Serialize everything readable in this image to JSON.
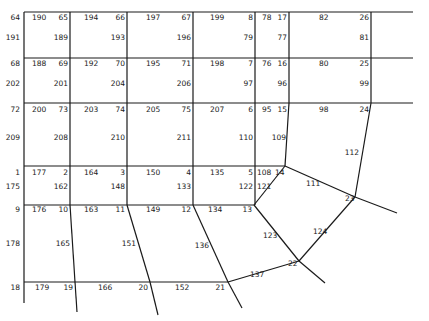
{
  "diagram": {
    "type": "finite-element-mesh",
    "edges": [
      [
        24,
        12,
        413,
        12
      ],
      [
        24,
        58,
        413,
        58
      ],
      [
        24,
        103,
        413,
        103
      ],
      [
        24,
        166,
        285,
        166
      ],
      [
        24,
        205,
        254,
        205
      ],
      [
        24,
        282,
        228,
        282
      ],
      [
        24,
        12,
        24,
        303
      ],
      [
        70,
        12,
        70,
        205
      ],
      [
        70,
        205,
        75,
        282
      ],
      [
        75,
        282,
        77,
        312
      ],
      [
        127,
        12,
        127,
        205
      ],
      [
        127,
        205,
        150,
        282
      ],
      [
        150,
        282,
        158,
        315
      ],
      [
        193,
        12,
        193,
        205
      ],
      [
        193,
        205,
        228,
        282
      ],
      [
        228,
        282,
        242,
        308
      ],
      [
        255,
        12,
        255,
        205
      ],
      [
        289,
        12,
        289,
        103
      ],
      [
        289,
        103,
        285,
        166
      ],
      [
        371,
        12,
        371,
        103
      ],
      [
        371,
        103,
        355,
        197
      ],
      [
        285,
        166,
        254,
        205
      ],
      [
        285,
        166,
        355,
        197
      ],
      [
        355,
        197,
        397,
        213
      ],
      [
        254,
        205,
        299,
        261
      ],
      [
        355,
        197,
        299,
        261
      ],
      [
        228,
        282,
        299,
        261
      ],
      [
        299,
        261,
        325,
        283
      ]
    ],
    "labels": [
      {
        "t": "64",
        "x": 20,
        "y": 20,
        "a": "end"
      },
      {
        "t": "190",
        "x": 32,
        "y": 20,
        "a": "start"
      },
      {
        "t": "65",
        "x": 68,
        "y": 20,
        "a": "end"
      },
      {
        "t": "194",
        "x": 84,
        "y": 20,
        "a": "start"
      },
      {
        "t": "66",
        "x": 125,
        "y": 20,
        "a": "end"
      },
      {
        "t": "197",
        "x": 146,
        "y": 20,
        "a": "start"
      },
      {
        "t": "67",
        "x": 191,
        "y": 20,
        "a": "end"
      },
      {
        "t": "199",
        "x": 210,
        "y": 20,
        "a": "start"
      },
      {
        "t": "8",
        "x": 253,
        "y": 20,
        "a": "end"
      },
      {
        "t": "78",
        "x": 262,
        "y": 20,
        "a": "start"
      },
      {
        "t": "17",
        "x": 287,
        "y": 20,
        "a": "end"
      },
      {
        "t": "82",
        "x": 319,
        "y": 20,
        "a": "start"
      },
      {
        "t": "26",
        "x": 369,
        "y": 20,
        "a": "end"
      },
      {
        "t": "191",
        "x": 20,
        "y": 40,
        "a": "end"
      },
      {
        "t": "189",
        "x": 68,
        "y": 40,
        "a": "end"
      },
      {
        "t": "193",
        "x": 125,
        "y": 40,
        "a": "end"
      },
      {
        "t": "196",
        "x": 191,
        "y": 40,
        "a": "end"
      },
      {
        "t": "79",
        "x": 253,
        "y": 40,
        "a": "end"
      },
      {
        "t": "77",
        "x": 287,
        "y": 40,
        "a": "end"
      },
      {
        "t": "81",
        "x": 369,
        "y": 40,
        "a": "end"
      },
      {
        "t": "68",
        "x": 20,
        "y": 66,
        "a": "end"
      },
      {
        "t": "188",
        "x": 32,
        "y": 66,
        "a": "start"
      },
      {
        "t": "69",
        "x": 68,
        "y": 66,
        "a": "end"
      },
      {
        "t": "192",
        "x": 84,
        "y": 66,
        "a": "start"
      },
      {
        "t": "70",
        "x": 125,
        "y": 66,
        "a": "end"
      },
      {
        "t": "195",
        "x": 146,
        "y": 66,
        "a": "start"
      },
      {
        "t": "71",
        "x": 191,
        "y": 66,
        "a": "end"
      },
      {
        "t": "198",
        "x": 210,
        "y": 66,
        "a": "start"
      },
      {
        "t": "7",
        "x": 253,
        "y": 66,
        "a": "end"
      },
      {
        "t": "76",
        "x": 262,
        "y": 66,
        "a": "start"
      },
      {
        "t": "16",
        "x": 287,
        "y": 66,
        "a": "end"
      },
      {
        "t": "80",
        "x": 319,
        "y": 66,
        "a": "start"
      },
      {
        "t": "25",
        "x": 369,
        "y": 66,
        "a": "end"
      },
      {
        "t": "202",
        "x": 20,
        "y": 86,
        "a": "end"
      },
      {
        "t": "201",
        "x": 68,
        "y": 86,
        "a": "end"
      },
      {
        "t": "204",
        "x": 125,
        "y": 86,
        "a": "end"
      },
      {
        "t": "206",
        "x": 191,
        "y": 86,
        "a": "end"
      },
      {
        "t": "97",
        "x": 253,
        "y": 86,
        "a": "end"
      },
      {
        "t": "96",
        "x": 287,
        "y": 86,
        "a": "end"
      },
      {
        "t": "99",
        "x": 369,
        "y": 86,
        "a": "end"
      },
      {
        "t": "72",
        "x": 20,
        "y": 112,
        "a": "end"
      },
      {
        "t": "200",
        "x": 32,
        "y": 112,
        "a": "start"
      },
      {
        "t": "73",
        "x": 68,
        "y": 112,
        "a": "end"
      },
      {
        "t": "203",
        "x": 84,
        "y": 112,
        "a": "start"
      },
      {
        "t": "74",
        "x": 125,
        "y": 112,
        "a": "end"
      },
      {
        "t": "205",
        "x": 146,
        "y": 112,
        "a": "start"
      },
      {
        "t": "75",
        "x": 191,
        "y": 112,
        "a": "end"
      },
      {
        "t": "207",
        "x": 210,
        "y": 112,
        "a": "start"
      },
      {
        "t": "6",
        "x": 253,
        "y": 112,
        "a": "end"
      },
      {
        "t": "95",
        "x": 262,
        "y": 112,
        "a": "start"
      },
      {
        "t": "15",
        "x": 287,
        "y": 112,
        "a": "end"
      },
      {
        "t": "98",
        "x": 319,
        "y": 112,
        "a": "start"
      },
      {
        "t": "24",
        "x": 369,
        "y": 112,
        "a": "end"
      },
      {
        "t": "209",
        "x": 20,
        "y": 140,
        "a": "end"
      },
      {
        "t": "208",
        "x": 68,
        "y": 140,
        "a": "end"
      },
      {
        "t": "210",
        "x": 125,
        "y": 140,
        "a": "end"
      },
      {
        "t": "211",
        "x": 191,
        "y": 140,
        "a": "end"
      },
      {
        "t": "110",
        "x": 253,
        "y": 140,
        "a": "end"
      },
      {
        "t": "109",
        "x": 286,
        "y": 140,
        "a": "end"
      },
      {
        "t": "112",
        "x": 359,
        "y": 155,
        "a": "end"
      },
      {
        "t": "1",
        "x": 20,
        "y": 175,
        "a": "end"
      },
      {
        "t": "177",
        "x": 32,
        "y": 175,
        "a": "start"
      },
      {
        "t": "2",
        "x": 68,
        "y": 175,
        "a": "end"
      },
      {
        "t": "164",
        "x": 84,
        "y": 175,
        "a": "start"
      },
      {
        "t": "3",
        "x": 125,
        "y": 175,
        "a": "end"
      },
      {
        "t": "150",
        "x": 146,
        "y": 175,
        "a": "start"
      },
      {
        "t": "4",
        "x": 191,
        "y": 175,
        "a": "end"
      },
      {
        "t": "135",
        "x": 210,
        "y": 175,
        "a": "start"
      },
      {
        "t": "5",
        "x": 253,
        "y": 175,
        "a": "end"
      },
      {
        "t": "108",
        "x": 257,
        "y": 175,
        "a": "start"
      },
      {
        "t": "14",
        "x": 275,
        "y": 175,
        "a": "start"
      },
      {
        "t": "111",
        "x": 306,
        "y": 186,
        "a": "start"
      },
      {
        "t": "175",
        "x": 20,
        "y": 189,
        "a": "end"
      },
      {
        "t": "162",
        "x": 68,
        "y": 189,
        "a": "end"
      },
      {
        "t": "148",
        "x": 125,
        "y": 189,
        "a": "end"
      },
      {
        "t": "133",
        "x": 191,
        "y": 189,
        "a": "end"
      },
      {
        "t": "122",
        "x": 253,
        "y": 189,
        "a": "end"
      },
      {
        "t": "121",
        "x": 257,
        "y": 189,
        "a": "start"
      },
      {
        "t": "23",
        "x": 345,
        "y": 201,
        "a": "start"
      },
      {
        "t": "9",
        "x": 20,
        "y": 212,
        "a": "end"
      },
      {
        "t": "176",
        "x": 32,
        "y": 212,
        "a": "start"
      },
      {
        "t": "10",
        "x": 68,
        "y": 212,
        "a": "end"
      },
      {
        "t": "163",
        "x": 84,
        "y": 212,
        "a": "start"
      },
      {
        "t": "11",
        "x": 125,
        "y": 212,
        "a": "end"
      },
      {
        "t": "149",
        "x": 146,
        "y": 212,
        "a": "start"
      },
      {
        "t": "12",
        "x": 191,
        "y": 212,
        "a": "end"
      },
      {
        "t": "134",
        "x": 208,
        "y": 212,
        "a": "start"
      },
      {
        "t": "13",
        "x": 252,
        "y": 212,
        "a": "end"
      },
      {
        "t": "123",
        "x": 263,
        "y": 238,
        "a": "start"
      },
      {
        "t": "124",
        "x": 313,
        "y": 234,
        "a": "start"
      },
      {
        "t": "178",
        "x": 20,
        "y": 246,
        "a": "end"
      },
      {
        "t": "165",
        "x": 70,
        "y": 246,
        "a": "end"
      },
      {
        "t": "151",
        "x": 136,
        "y": 246,
        "a": "end"
      },
      {
        "t": "136",
        "x": 209,
        "y": 248,
        "a": "end"
      },
      {
        "t": "22",
        "x": 288,
        "y": 266,
        "a": "start"
      },
      {
        "t": "137",
        "x": 250,
        "y": 277,
        "a": "start"
      },
      {
        "t": "18",
        "x": 20,
        "y": 290,
        "a": "end"
      },
      {
        "t": "179",
        "x": 35,
        "y": 290,
        "a": "start"
      },
      {
        "t": "19",
        "x": 73,
        "y": 290,
        "a": "end"
      },
      {
        "t": "166",
        "x": 98,
        "y": 290,
        "a": "start"
      },
      {
        "t": "20",
        "x": 148,
        "y": 290,
        "a": "end"
      },
      {
        "t": "152",
        "x": 175,
        "y": 290,
        "a": "start"
      },
      {
        "t": "21",
        "x": 225,
        "y": 290,
        "a": "end"
      }
    ]
  }
}
